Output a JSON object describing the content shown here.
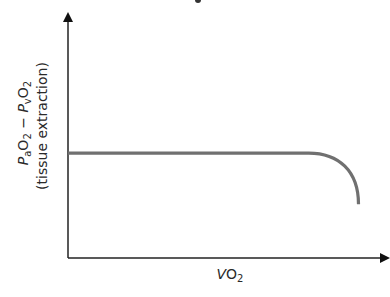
{
  "chart_data": {
    "type": "line",
    "title": "",
    "xlabel": "VO2",
    "ylabel_line1": "PaO2 - PvO2",
    "ylabel_line2": "(tissue extraction)",
    "grid": false,
    "legend": null,
    "ticks": {
      "x": [],
      "y": []
    },
    "axis_ranges": {
      "x": [
        0,
        1
      ],
      "y": [
        0,
        1
      ]
    },
    "series": [
      {
        "name": "tissue extraction",
        "description": "Constant (plateau) across most of VO2 range, then curves sharply downward at high VO2",
        "points": [
          {
            "x": 0.0,
            "y": 0.43
          },
          {
            "x": 0.25,
            "y": 0.43
          },
          {
            "x": 0.5,
            "y": 0.43
          },
          {
            "x": 0.75,
            "y": 0.43
          },
          {
            "x": 0.8,
            "y": 0.428
          },
          {
            "x": 0.85,
            "y": 0.4
          },
          {
            "x": 0.88,
            "y": 0.35
          },
          {
            "x": 0.9,
            "y": 0.28
          },
          {
            "x": 0.905,
            "y": 0.22
          }
        ],
        "color": "#707070"
      }
    ]
  },
  "labels": {
    "y_line1": {
      "P": "P",
      "a": "a",
      "O": "O",
      "two": "2",
      "minus": " − ",
      "v": "v"
    },
    "y_line2": "(tissue extraction)",
    "x": {
      "V": "V",
      "O": "O",
      "two": "2"
    }
  }
}
